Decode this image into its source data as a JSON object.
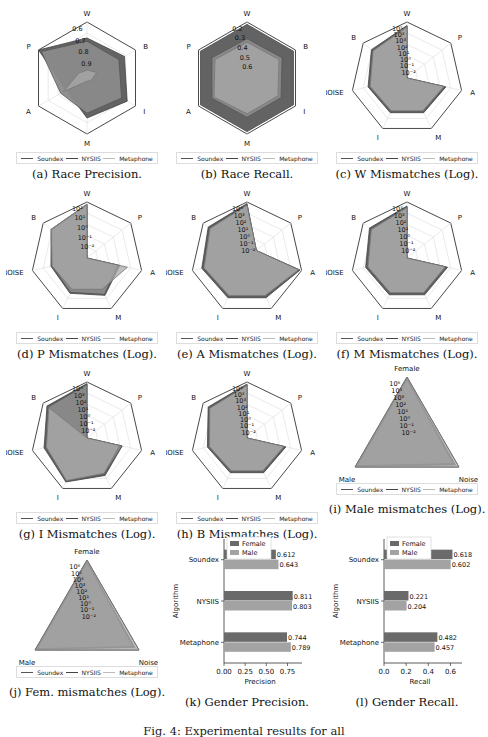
{
  "figure_caption": "Fig. 4: Experimental results for all",
  "legend": {
    "entries": [
      "Soundex",
      "NYSIIS",
      "Metaphone"
    ],
    "colors": {
      "Soundex": "#555555",
      "NYSIIS": "#444444",
      "Metaphone": "#bbbbbb"
    }
  },
  "colors": {
    "fill_dark": "#5b5b5b",
    "fill_mid": "#8a8a8a",
    "fill_light": "#a9a9a9",
    "bar_female": "#6a6a6a",
    "bar_male": "#a3a3a3",
    "grid": "#dcdcdc",
    "frame": "#333333"
  },
  "chart_data": [
    {
      "id": "a",
      "type": "radar",
      "caption": "(a) Race Precision.",
      "axes": [
        "W",
        "B",
        "I",
        "M",
        "A",
        "P"
      ],
      "tick_labels": [
        "0.6",
        "0.7",
        "0.8",
        "0.9"
      ],
      "rlim": [
        0.55,
        0.9
      ],
      "series": [
        {
          "name": "Soundex",
          "values": [
            0.8,
            0.82,
            0.84,
            0.8,
            0.7,
            0.9
          ]
        },
        {
          "name": "NYSIIS",
          "values": [
            0.78,
            0.78,
            0.8,
            0.77,
            0.74,
            0.88
          ]
        },
        {
          "name": "Metaphone",
          "values": [
            0.6,
            0.62,
            0.58,
            0.57,
            0.72,
            0.61
          ]
        }
      ]
    },
    {
      "id": "b",
      "type": "radar",
      "caption": "(b) Race Recall.",
      "axes": [
        "W",
        "B",
        "I",
        "M",
        "A",
        "P"
      ],
      "tick_labels": [
        "0.2",
        "0.3",
        "0.4",
        "0.5",
        "0.6"
      ],
      "rlim": [
        0.15,
        0.62
      ],
      "series": [
        {
          "name": "Soundex",
          "values": [
            0.6,
            0.6,
            0.6,
            0.6,
            0.6,
            0.6
          ]
        },
        {
          "name": "NYSIIS",
          "values": [
            0.48,
            0.49,
            0.48,
            0.48,
            0.49,
            0.49
          ]
        },
        {
          "name": "Metaphone",
          "values": [
            0.45,
            0.46,
            0.45,
            0.45,
            0.47,
            0.46
          ]
        }
      ]
    },
    {
      "id": "c",
      "type": "radar",
      "caption": "(c) W Mismatches (Log).",
      "scale": "log",
      "axes": [
        "W",
        "P",
        "A",
        "M",
        "I",
        "NOISE",
        "B"
      ],
      "tick_labels": [
        "10⁵",
        "10⁴",
        "10³",
        "10²",
        "10¹",
        "10⁰",
        "10⁻¹",
        "10⁻²"
      ],
      "rlim_log10": [
        -2.5,
        5.5
      ],
      "series": [
        {
          "name": "Soundex",
          "values_log10": [
            5.0,
            -2.5,
            3.2,
            3.0,
            3.0,
            3.2,
            4.0
          ]
        },
        {
          "name": "NYSIIS",
          "values_log10": [
            4.9,
            -2.5,
            3.0,
            2.8,
            2.8,
            3.0,
            3.8
          ]
        },
        {
          "name": "Metaphone",
          "values_log10": [
            4.8,
            -2.5,
            2.9,
            2.7,
            2.7,
            2.9,
            3.7
          ]
        }
      ]
    },
    {
      "id": "d",
      "type": "radar",
      "caption": "(d) P Mismatches (Log).",
      "scale": "log",
      "axes": [
        "W",
        "P",
        "A",
        "M",
        "I",
        "NOISE",
        "B"
      ],
      "tick_labels": [
        "10²",
        "10¹",
        "10⁰",
        "10⁻¹",
        "10⁻²"
      ],
      "rlim_log10": [
        -2.5,
        2.5
      ],
      "series": [
        {
          "name": "Soundex",
          "values_log10": [
            2.3,
            -2.5,
            0.5,
            1.2,
            1.0,
            0.8,
            1.6
          ]
        },
        {
          "name": "NYSIIS",
          "values_log10": [
            2.2,
            -2.5,
            0.3,
            1.1,
            0.9,
            0.7,
            1.5
          ]
        },
        {
          "name": "Metaphone",
          "values_log10": [
            2.3,
            -2.5,
            1.2,
            0.6,
            0.6,
            0.7,
            1.6
          ]
        }
      ]
    },
    {
      "id": "e",
      "type": "radar",
      "caption": "(e) A Mismatches (Log).",
      "scale": "log",
      "axes": [
        "W",
        "P",
        "A",
        "M",
        "I",
        "NOISE",
        "B"
      ],
      "tick_labels": [
        "10⁴",
        "10³",
        "10²",
        "10¹",
        "10⁰",
        "10⁻¹",
        "10⁻²"
      ],
      "rlim_log10": [
        -2.5,
        4.5
      ],
      "series": [
        {
          "name": "Soundex",
          "values_log10": [
            4.3,
            -1.0,
            4.3,
            3.0,
            3.0,
            3.3,
            3.7
          ]
        },
        {
          "name": "NYSIIS",
          "values_log10": [
            4.2,
            -1.0,
            4.2,
            2.8,
            2.8,
            3.1,
            3.5
          ]
        },
        {
          "name": "Metaphone",
          "values_log10": [
            4.1,
            -1.0,
            4.1,
            2.7,
            2.7,
            3.0,
            3.4
          ]
        }
      ]
    },
    {
      "id": "f",
      "type": "radar",
      "caption": "(f) M Mismatches (Log).",
      "scale": "log",
      "axes": [
        "W",
        "P",
        "A",
        "M",
        "I",
        "NOISE",
        "B"
      ],
      "tick_labels": [
        "10⁴",
        "10³",
        "10²",
        "10¹",
        "10⁰",
        "10⁻¹",
        "10⁻²"
      ],
      "rlim_log10": [
        -2.5,
        4.5
      ],
      "series": [
        {
          "name": "Soundex",
          "values_log10": [
            4.0,
            -2.5,
            2.7,
            2.6,
            2.6,
            2.8,
            3.5
          ]
        },
        {
          "name": "NYSIIS",
          "values_log10": [
            3.9,
            -2.5,
            2.5,
            2.4,
            2.4,
            2.6,
            3.3
          ]
        },
        {
          "name": "Metaphone",
          "values_log10": [
            3.8,
            -2.5,
            2.4,
            2.3,
            2.3,
            2.5,
            3.2
          ]
        }
      ]
    },
    {
      "id": "g",
      "type": "radar",
      "caption": "(g) I Mismatches (Log).",
      "scale": "log",
      "axes": [
        "W",
        "P",
        "A",
        "M",
        "I",
        "NOISE",
        "B"
      ],
      "tick_labels": [
        "10⁴",
        "10³",
        "10²",
        "10¹",
        "10⁰",
        "10⁻¹",
        "10⁻²"
      ],
      "rlim_log10": [
        -2.5,
        4.5
      ],
      "series": [
        {
          "name": "Soundex",
          "values_log10": [
            4.3,
            -2.5,
            2.0,
            2.7,
            3.6,
            3.0,
            3.9
          ]
        },
        {
          "name": "NYSIIS",
          "values_log10": [
            4.2,
            -2.5,
            2.0,
            2.5,
            3.5,
            2.8,
            3.7
          ]
        },
        {
          "name": "Metaphone",
          "values_log10": [
            -2.5,
            -2.5,
            1.7,
            2.4,
            3.4,
            2.7,
            3.6
          ]
        }
      ]
    },
    {
      "id": "h",
      "type": "radar",
      "caption": "(h) B Mismatches (Log).",
      "scale": "log",
      "axes": [
        "W",
        "P",
        "A",
        "M",
        "I",
        "NOISE",
        "B"
      ],
      "tick_labels": [
        "10⁵",
        "10⁴",
        "10³",
        "10²",
        "10¹",
        "10⁰",
        "10⁻¹",
        "10⁻²"
      ],
      "rlim_log10": [
        -2.5,
        5.5
      ],
      "series": [
        {
          "name": "Soundex",
          "values_log10": [
            5.2,
            -2.5,
            3.2,
            3.0,
            3.0,
            3.3,
            4.6
          ]
        },
        {
          "name": "NYSIIS",
          "values_log10": [
            5.1,
            -2.5,
            3.0,
            2.8,
            2.8,
            3.1,
            4.4
          ]
        },
        {
          "name": "Metaphone",
          "values_log10": [
            5.0,
            -2.5,
            2.9,
            2.7,
            2.7,
            3.0,
            4.3
          ]
        }
      ]
    },
    {
      "id": "i",
      "type": "radar",
      "caption": "(i) Male mismatches (Log).",
      "scale": "log",
      "axes": [
        "Female",
        "Noise",
        "Male"
      ],
      "tick_labels": [
        "10⁶",
        "10⁴",
        "10³",
        "10²",
        "10¹",
        "10⁰",
        "10⁻¹",
        "10⁻²"
      ],
      "rlim_log10": [
        -2.5,
        6.2
      ],
      "series": [
        {
          "name": "Soundex",
          "values_log10": [
            6.0,
            5.6,
            6.0
          ]
        },
        {
          "name": "NYSIIS",
          "values_log10": [
            5.8,
            5.2,
            5.8
          ]
        },
        {
          "name": "Metaphone",
          "values_log10": [
            6.2,
            6.2,
            6.2
          ]
        }
      ]
    },
    {
      "id": "j",
      "type": "radar",
      "caption": "(j) Fem. mismatches (Log).",
      "scale": "log",
      "axes": [
        "Female",
        "Noise",
        "Male"
      ],
      "tick_labels": [
        "10⁶",
        "10⁵",
        "10⁴",
        "10³",
        "10²",
        "10¹",
        "10⁰",
        "10⁻¹",
        "10⁻²"
      ],
      "rlim_log10": [
        -2.5,
        6.2
      ],
      "series": [
        {
          "name": "Soundex",
          "values_log10": [
            6.0,
            5.5,
            6.0
          ]
        },
        {
          "name": "NYSIIS",
          "values_log10": [
            5.8,
            5.2,
            5.8
          ]
        },
        {
          "name": "Metaphone",
          "values_log10": [
            6.2,
            6.2,
            6.2
          ]
        }
      ]
    },
    {
      "id": "k",
      "type": "bar",
      "orientation": "horizontal",
      "caption": "(k) Gender Precision.",
      "categories": [
        "Soundex",
        "NYSIIS",
        "Metaphone"
      ],
      "series": [
        {
          "name": "Female",
          "values": [
            0.612,
            0.811,
            0.744
          ]
        },
        {
          "name": "Male",
          "values": [
            0.643,
            0.803,
            0.789
          ]
        }
      ],
      "data_labels": [
        [
          "0.612",
          "0.643"
        ],
        [
          "0.811",
          "0.803"
        ],
        [
          "0.744",
          "0.789"
        ]
      ],
      "xlabel": "Precision",
      "ylabel": "Algorithm",
      "xticks": [
        "0.00",
        "0.25",
        "0.50",
        "0.75"
      ],
      "xtick_values": [
        0,
        0.25,
        0.5,
        0.75
      ],
      "xlim": [
        0,
        0.85
      ],
      "legend": [
        "Female",
        "Male"
      ],
      "legend_position": "top-left"
    },
    {
      "id": "l",
      "type": "bar",
      "orientation": "horizontal",
      "caption": "(l) Gender Recall.",
      "categories": [
        "Soundex",
        "NYSIIS",
        "Metaphone"
      ],
      "series": [
        {
          "name": "Female",
          "values": [
            0.618,
            0.221,
            0.482
          ]
        },
        {
          "name": "Male",
          "values": [
            0.602,
            0.204,
            0.457
          ]
        }
      ],
      "data_labels": [
        [
          "0.618",
          "0.602"
        ],
        [
          "0.221",
          "0.204"
        ],
        [
          "0.482",
          "0.457"
        ]
      ],
      "xlabel": "Recall",
      "ylabel": "Algorithm",
      "xticks": [
        "0.0",
        "0.2",
        "0.4",
        "0.6"
      ],
      "xtick_values": [
        0,
        0.2,
        0.4,
        0.6
      ],
      "xlim": [
        0,
        0.65
      ],
      "legend": [
        "Female",
        "Male"
      ],
      "legend_position": "top-left"
    }
  ]
}
